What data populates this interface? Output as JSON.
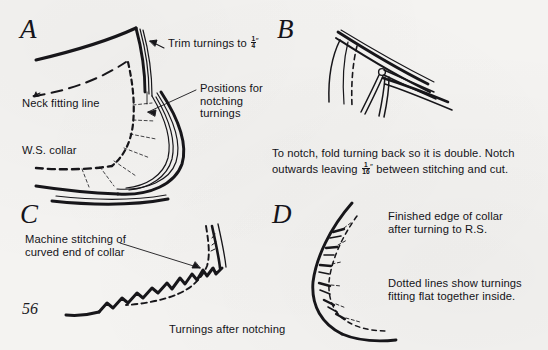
{
  "page": {
    "number": "56",
    "background_color": "#f4f3f1",
    "ink_color": "#17161a"
  },
  "panels": [
    {
      "id": "A",
      "letter": "A",
      "labels": {
        "trim": "Trim turnings to ",
        "trim_fraction_numerator": "1",
        "trim_fraction_denominator": "4",
        "trim_inch_mark": "″",
        "neck_fitting_line": "Neck fitting line",
        "ws_collar": "W.S. collar",
        "positions_for_notching": "Positions for\nnotching\nturnings"
      }
    },
    {
      "id": "B",
      "letter": "B",
      "caption_part1": "To notch, fold turning back so it is double. Notch",
      "caption_part2_before": "outwards leaving ",
      "caption_fraction_numerator": "1",
      "caption_fraction_denominator": "16",
      "caption_inch_mark": "″",
      "caption_part2_after": " between stitching and cut."
    },
    {
      "id": "C",
      "letter": "C",
      "labels": {
        "machine_stitching": "Machine stitching of\ncurved end of collar",
        "turnings_after_notching": "Turnings after notching"
      }
    },
    {
      "id": "D",
      "letter": "D",
      "labels": {
        "finished_edge": "Finished edge of collar\nafter turning to R.S.",
        "dotted_lines": "Dotted lines show turnings\nfitting flat together inside."
      }
    }
  ]
}
